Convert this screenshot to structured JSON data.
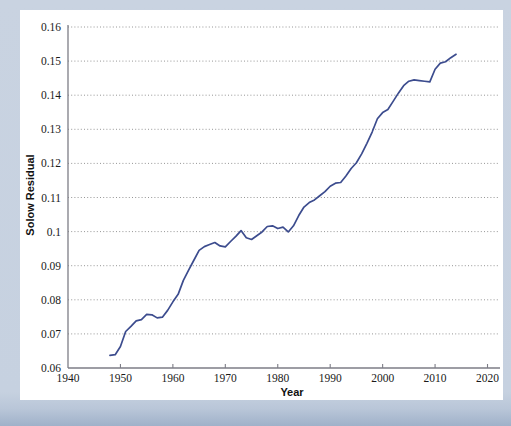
{
  "figure": {
    "background_color": "#c4d0e0",
    "panel_color": "#ffffff"
  },
  "chart_data": {
    "type": "line",
    "title": "",
    "xlabel": "Year",
    "ylabel": "Solow Residual",
    "xlim": [
      1940,
      2022
    ],
    "ylim": [
      0.06,
      0.16
    ],
    "xticks": [
      1940,
      1950,
      1960,
      1970,
      1980,
      1990,
      2000,
      2010,
      2020
    ],
    "xtick_labels": [
      "1940",
      "1950",
      "1960",
      "1970",
      "1980",
      "1990",
      "2000",
      "2010",
      "2020"
    ],
    "yticks": [
      0.06,
      0.07,
      0.08,
      0.09,
      0.1,
      0.11,
      0.12,
      0.13,
      0.14,
      0.15,
      0.16
    ],
    "ytick_labels": [
      "0.06",
      "0.07",
      "0.08",
      "0.09",
      "0.1",
      "0.11",
      "0.12",
      "0.13",
      "0.14",
      "0.15",
      "0.16"
    ],
    "grid": "horizontal-dotted",
    "legend": "none",
    "line_color": "#3c4c8e",
    "series": [
      {
        "name": "Solow Residual",
        "x": [
          1948,
          1949,
          1950,
          1951,
          1952,
          1953,
          1954,
          1955,
          1956,
          1957,
          1958,
          1959,
          1960,
          1961,
          1962,
          1963,
          1964,
          1965,
          1966,
          1967,
          1968,
          1969,
          1970,
          1971,
          1972,
          1973,
          1974,
          1975,
          1976,
          1977,
          1978,
          1979,
          1980,
          1981,
          1982,
          1983,
          1984,
          1985,
          1986,
          1987,
          1988,
          1989,
          1990,
          1991,
          1992,
          1993,
          1994,
          1995,
          1996,
          1997,
          1998,
          1999,
          2000,
          2001,
          2002,
          2003,
          2004,
          2005,
          2006,
          2007,
          2008,
          2009,
          2010,
          2011,
          2012,
          2013,
          2014
        ],
        "y": [
          0.0637,
          0.0639,
          0.0663,
          0.0707,
          0.0722,
          0.0738,
          0.0742,
          0.0757,
          0.0756,
          0.0747,
          0.0749,
          0.0769,
          0.0794,
          0.0816,
          0.0857,
          0.0887,
          0.0916,
          0.0945,
          0.0956,
          0.0962,
          0.0968,
          0.0958,
          0.0955,
          0.0971,
          0.0986,
          0.1003,
          0.0982,
          0.0977,
          0.0988,
          0.0999,
          0.1015,
          0.1017,
          0.1009,
          0.1013,
          0.0999,
          0.1017,
          0.1047,
          0.1072,
          0.1085,
          0.1093,
          0.1105,
          0.1117,
          0.1133,
          0.1142,
          0.1144,
          0.1163,
          0.1185,
          0.1202,
          0.1228,
          0.1259,
          0.1292,
          0.1331,
          0.1349,
          0.1358,
          0.1382,
          0.1406,
          0.1428,
          0.1441,
          0.1445,
          0.1443,
          0.1441,
          0.1439,
          0.1476,
          0.1494,
          0.1498,
          0.151,
          0.152
        ]
      }
    ]
  }
}
